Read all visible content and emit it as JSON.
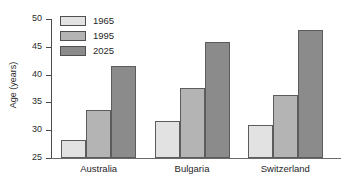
{
  "chart_data": {
    "type": "bar",
    "title": "",
    "xlabel": "",
    "ylabel": "Age (years)",
    "categories": [
      "Australia",
      "Bulgaria",
      "Switzerland"
    ],
    "series": [
      {
        "name": "1965",
        "values": [
          28.3,
          31.7,
          30.9
        ],
        "color": "#e2e2e2"
      },
      {
        "name": "1995",
        "values": [
          33.6,
          37.6,
          36.4
        ],
        "color": "#b4b4b4"
      },
      {
        "name": "2025",
        "values": [
          41.5,
          45.8,
          48.0
        ],
        "color": "#8b8b8b"
      }
    ],
    "ylim": [
      25,
      50
    ],
    "yticks": [
      25,
      30,
      35,
      40,
      45,
      50
    ],
    "ytick_labels": [
      "25",
      "30",
      "35",
      "40",
      "45",
      "50"
    ],
    "grid": false,
    "legend_position": "top-left",
    "axis_color": "#4a4a4a",
    "bar_border_color": "#5c5c5c"
  }
}
